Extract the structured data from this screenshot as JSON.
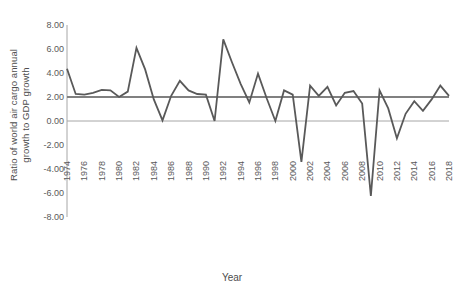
{
  "chart_data": {
    "type": "line",
    "title": "",
    "xlabel": "Year",
    "ylabel": "Ratio of world air cargo annual growth to GDP growth",
    "ylabel_line1": "Ratio of world air cargo annual",
    "ylabel_line2": "growth to GDP growth",
    "xlim": [
      1974,
      2018
    ],
    "ylim": [
      -8.0,
      8.0
    ],
    "y_ticks": [
      "8.00",
      "6.00",
      "4.00",
      "2.00",
      "0.00",
      "-2.00",
      "-4.00",
      "-6.00",
      "-8.00"
    ],
    "y_tick_values": [
      8.0,
      6.0,
      4.0,
      2.0,
      0.0,
      -2.0,
      -4.0,
      -6.0,
      -8.0
    ],
    "x_ticks": [
      "1974",
      "1976",
      "1978",
      "1980",
      "1982",
      "1984",
      "1986",
      "1988",
      "1990",
      "1992",
      "1994",
      "1996",
      "1998",
      "2000",
      "2002",
      "2004",
      "2006",
      "2008",
      "2010",
      "2012",
      "2014",
      "2016",
      "2018"
    ],
    "x_tick_values": [
      1974,
      1976,
      1978,
      1980,
      1982,
      1984,
      1986,
      1988,
      1990,
      1992,
      1994,
      1996,
      1998,
      2000,
      2002,
      2004,
      2006,
      2008,
      2010,
      2012,
      2014,
      2016,
      2018
    ],
    "grid": false,
    "legend": false,
    "series": [
      {
        "name": "Ratio of world air cargo annual growth to GDP growth",
        "color": "#595959",
        "x": [
          1974,
          1975,
          1976,
          1977,
          1978,
          1979,
          1980,
          1981,
          1982,
          1983,
          1984,
          1985,
          1986,
          1987,
          1988,
          1989,
          1990,
          1991,
          1992,
          1993,
          1994,
          1995,
          1996,
          1997,
          1998,
          1999,
          2000,
          2001,
          2002,
          2003,
          2004,
          2005,
          2006,
          2007,
          2008,
          2009,
          2010,
          2011,
          2012,
          2013,
          2014,
          2015,
          2016,
          2017,
          2018
        ],
        "values": [
          4.35,
          2.25,
          2.2,
          2.35,
          2.6,
          2.55,
          2.0,
          2.45,
          6.1,
          4.3,
          1.8,
          0.05,
          2.1,
          3.35,
          2.55,
          2.25,
          2.2,
          0.0,
          6.8,
          4.9,
          3.1,
          1.55,
          3.95,
          1.9,
          0.0,
          2.55,
          2.2,
          -3.4,
          2.95,
          2.1,
          2.85,
          1.3,
          2.35,
          2.5,
          1.45,
          -6.25,
          2.55,
          1.05,
          -1.45,
          0.6,
          1.65,
          0.85,
          1.8,
          2.95,
          2.1
        ]
      },
      {
        "name": "Reference line at 2.00",
        "color": "#808080",
        "constant": 2.0
      }
    ]
  },
  "axis": {
    "y_title": "Ratio of world air cargo annual growth to GDP growth",
    "x_title": "Year"
  }
}
